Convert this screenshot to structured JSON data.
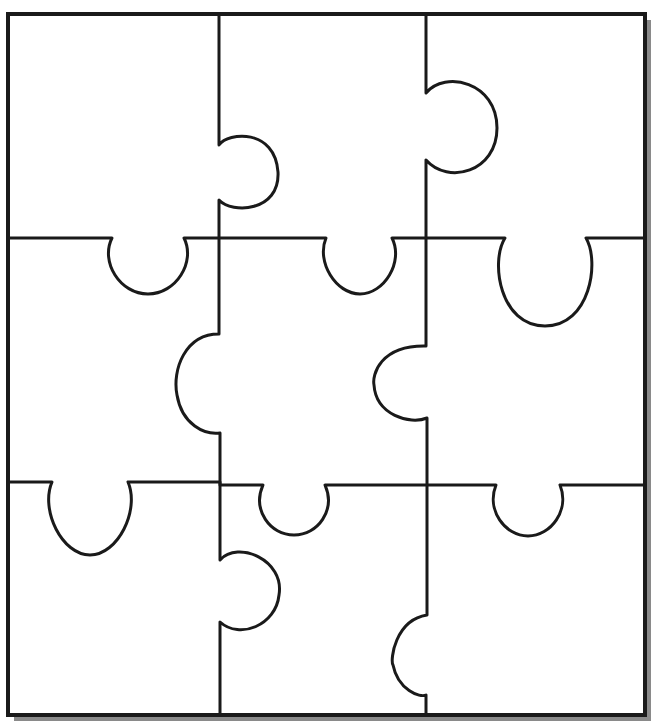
{
  "diagram": {
    "type": "jigsaw-puzzle-template",
    "grid": {
      "rows": 3,
      "cols": 3
    },
    "colors": {
      "background": "#ffffff",
      "piece_fill": "#ffffff",
      "line": "#1a1a1a",
      "border": "#1a1a1a",
      "shadow": "#8a8a8a"
    },
    "stroke_width": 3,
    "border_width": 4,
    "frame": {
      "x": 8,
      "y": 14,
      "width": 637,
      "height": 701
    },
    "shadow_offset": 6,
    "cut_paths": [
      {
        "name": "vertical-cut-left",
        "d": "M 219 14 L 219 145 C 228 132 275 128 278 172 C 280 212 232 214 219 200 L 219 334 C 185 334 172 370 177 395 C 182 425 205 435 220 433 L 220 560 C 238 540 285 560 279 595 C 276 625 240 640 220 622 L 220 715"
      },
      {
        "name": "vertical-cut-right",
        "d": "M 426 14 L 426 93 C 445 70 497 82 497 128 C 497 172 448 185 426 160 L 426 346 C 380 345 372 375 374 385 C 376 415 410 425 427 418 L 427 615 C 395 620 390 660 393 665 C 398 690 420 698 426 695 L 426 715"
      },
      {
        "name": "horizontal-cut-top",
        "d": "M 8 238 L 112 238 C 100 262 120 294 148 294 C 176 294 196 262 184 238 L 326 238 C 316 262 336 294 360 294 C 384 294 404 262 392 238 L 505 238 C 490 262 500 326 545 326 C 590 326 600 262 586 238 L 645 238"
      },
      {
        "name": "horizontal-cut-bottom",
        "d": "M 8 482 L 52 482 C 40 510 62 555 90 555 C 118 555 140 510 128 482 L 220 482 L 220 485 L 263 485 C 252 510 270 535 294 535 C 318 535 336 510 325 485 L 496 485 C 486 510 505 536 528 536 C 551 536 570 510 560 485 L 645 485"
      }
    ]
  }
}
